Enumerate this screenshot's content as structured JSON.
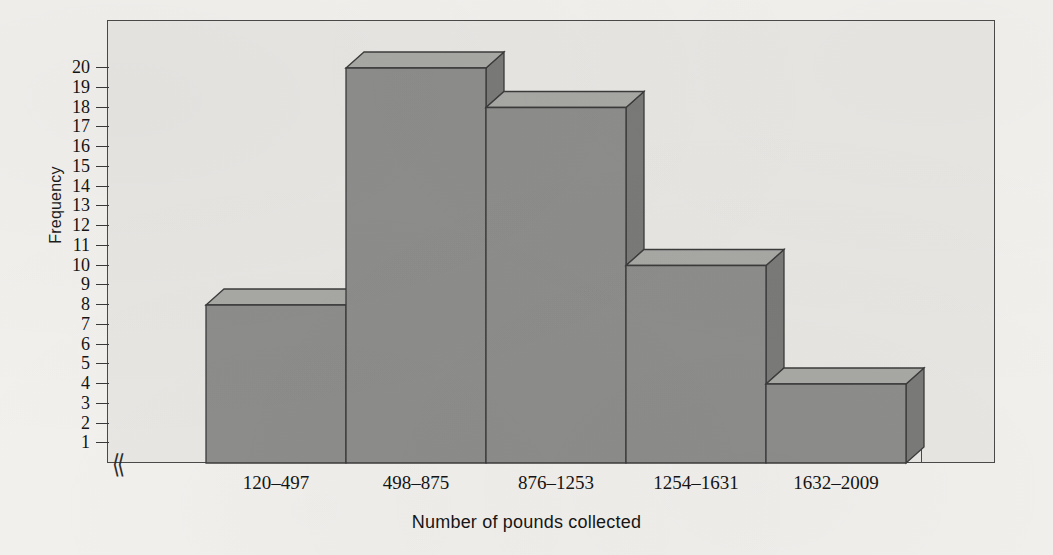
{
  "chart_data": {
    "type": "bar",
    "title": "",
    "xlabel": "Number of pounds collected",
    "ylabel": "Frequency",
    "categories": [
      "120–497",
      "498–875",
      "876–1253",
      "1254–1631",
      "1632–2009"
    ],
    "values": [
      8,
      20,
      18,
      10,
      4
    ],
    "ylim": [
      0,
      20
    ],
    "ytick_labels": [
      "1",
      "2",
      "3",
      "4",
      "5",
      "6",
      "7",
      "8",
      "9",
      "10",
      "11",
      "12",
      "13",
      "14",
      "15",
      "16",
      "17",
      "18",
      "19",
      "20"
    ],
    "ytick_values": [
      1,
      2,
      3,
      4,
      5,
      6,
      7,
      8,
      9,
      10,
      11,
      12,
      13,
      14,
      15,
      16,
      17,
      18,
      19,
      20
    ],
    "grid": false,
    "legend": null,
    "axis_break_symbol": "⟨⟨",
    "style": "3d-extruded-histogram",
    "colors": {
      "page_background": "#f4f2ef",
      "plot_background": "#e9e8e5",
      "frame_line": "#4a4a4a",
      "bar_front": "#8e8e8c",
      "bar_top": "#a9a9a6",
      "bar_side": "#7b7b79",
      "bar_outline": "#3c3c3c",
      "text": "#141414"
    }
  },
  "axes": {
    "y_title": "Frequency",
    "x_title": "Number of pounds collected"
  }
}
